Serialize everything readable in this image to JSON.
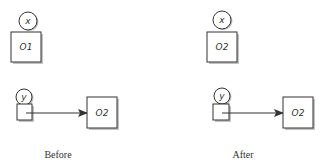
{
  "diagram": {
    "colors": {
      "stroke": "#333333",
      "shadow": "#9a9a9a",
      "fill": "#ffffff",
      "text": "#333333"
    },
    "panels": [
      {
        "caption": "Before",
        "top_variable": {
          "name": "x",
          "object": "O1"
        },
        "bottom_variable": {
          "name": "y",
          "points_to": "O2"
        }
      },
      {
        "caption": "After",
        "top_variable": {
          "name": "x",
          "object": "O2"
        },
        "bottom_variable": {
          "name": "y",
          "points_to": "O2"
        }
      }
    ]
  }
}
